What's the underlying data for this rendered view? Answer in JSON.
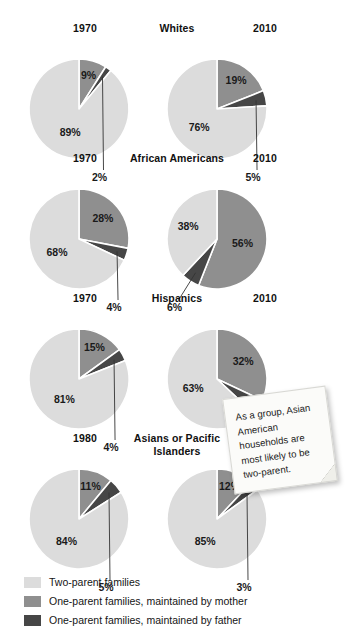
{
  "chart_data": {
    "type": "pie",
    "title": "",
    "subtitle": "",
    "note": "As a group, Asian American households are most likely to be two-parent.",
    "legend_position": "bottom-left",
    "categories": [
      "Two-parent families",
      "One-parent families, maintained by mother",
      "One-parent families, maintained by father"
    ],
    "colors": {
      "two_parent": "#dcdcdc",
      "mother": "#8f8f8f",
      "father": "#464646",
      "slice_border": "#ffffff",
      "text": "#1a1a1a",
      "background": "#ffffff",
      "note_bg": "#fbfbf9"
    },
    "unit": "%",
    "groups": [
      {
        "name": "Whites",
        "charts": [
          {
            "year": "1970",
            "slices": [
              {
                "label": "89%",
                "value": 89,
                "category": "Two-parent families",
                "color_key": "two_parent",
                "placement": "inside"
              },
              {
                "label": "9%",
                "value": 9,
                "category": "One-parent families, maintained by mother",
                "color_key": "mother",
                "placement": "inside"
              },
              {
                "label": "2%",
                "value": 2,
                "category": "One-parent families, maintained by father",
                "color_key": "father",
                "placement": "outside"
              }
            ]
          },
          {
            "year": "2010",
            "slices": [
              {
                "label": "76%",
                "value": 76,
                "category": "Two-parent families",
                "color_key": "two_parent",
                "placement": "inside"
              },
              {
                "label": "19%",
                "value": 19,
                "category": "One-parent families, maintained by mother",
                "color_key": "mother",
                "placement": "inside"
              },
              {
                "label": "5%",
                "value": 5,
                "category": "One-parent families, maintained by father",
                "color_key": "father",
                "placement": "outside"
              }
            ]
          }
        ]
      },
      {
        "name": "African Americans",
        "charts": [
          {
            "year": "1970",
            "slices": [
              {
                "label": "68%",
                "value": 68,
                "category": "Two-parent families",
                "color_key": "two_parent",
                "placement": "inside"
              },
              {
                "label": "28%",
                "value": 28,
                "category": "One-parent families, maintained by mother",
                "color_key": "mother",
                "placement": "inside"
              },
              {
                "label": "4%",
                "value": 4,
                "category": "One-parent families, maintained by father",
                "color_key": "father",
                "placement": "outside"
              }
            ]
          },
          {
            "year": "2010",
            "slices": [
              {
                "label": "38%",
                "value": 38,
                "category": "Two-parent families",
                "color_key": "two_parent",
                "placement": "inside"
              },
              {
                "label": "56%",
                "value": 56,
                "category": "One-parent families, maintained by mother",
                "color_key": "mother",
                "placement": "inside"
              },
              {
                "label": "6%",
                "value": 6,
                "category": "One-parent families, maintained by father",
                "color_key": "father",
                "placement": "outside"
              }
            ]
          }
        ]
      },
      {
        "name": "Hispanics",
        "charts": [
          {
            "year": "1970",
            "slices": [
              {
                "label": "81%",
                "value": 81,
                "category": "Two-parent families",
                "color_key": "two_parent",
                "placement": "inside"
              },
              {
                "label": "15%",
                "value": 15,
                "category": "One-parent families, maintained by mother",
                "color_key": "mother",
                "placement": "inside"
              },
              {
                "label": "4%",
                "value": 4,
                "category": "One-parent families, maintained by father",
                "color_key": "father",
                "placement": "outside"
              }
            ]
          },
          {
            "year": "2010",
            "slices": [
              {
                "label": "63%",
                "value": 63,
                "category": "Two-parent families",
                "color_key": "two_parent",
                "placement": "inside"
              },
              {
                "label": "32%",
                "value": 32,
                "category": "One-parent families, maintained by mother",
                "color_key": "mother",
                "placement": "inside"
              },
              {
                "label": "5%",
                "value": 5,
                "category": "One-parent families, maintained by father",
                "color_key": "father",
                "placement": "outside"
              }
            ]
          }
        ]
      },
      {
        "name": "Asians or Pacific Islanders",
        "charts": [
          {
            "year": "1980",
            "slices": [
              {
                "label": "84%",
                "value": 84,
                "category": "Two-parent families",
                "color_key": "two_parent",
                "placement": "inside"
              },
              {
                "label": "11%",
                "value": 11,
                "category": "One-parent families, maintained by mother",
                "color_key": "mother",
                "placement": "inside"
              },
              {
                "label": "5%",
                "value": 5,
                "category": "One-parent families, maintained by father",
                "color_key": "father",
                "placement": "outside"
              }
            ]
          },
          {
            "year": "2010",
            "slices": [
              {
                "label": "85%",
                "value": 85,
                "category": "Two-parent families",
                "color_key": "two_parent",
                "placement": "inside"
              },
              {
                "label": "12%",
                "value": 12,
                "category": "One-parent families, maintained by mother",
                "color_key": "mother",
                "placement": "inside"
              },
              {
                "label": "3%",
                "value": 3,
                "category": "One-parent families, maintained by father",
                "color_key": "father",
                "placement": "outside"
              }
            ]
          }
        ]
      }
    ]
  }
}
